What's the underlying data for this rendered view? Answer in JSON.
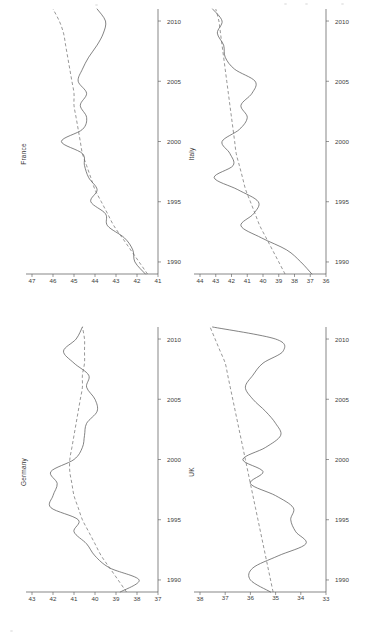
{
  "figure": {
    "orientation": "rotated-90-ccw",
    "background": "#ffffff",
    "line_color": "#5a5a5a",
    "trend_color": "#6a6a6a",
    "panel_count": 4
  },
  "chart_data": [
    {
      "type": "line",
      "title": "France",
      "xlabel": "",
      "ylabel": "",
      "xlim": [
        1989,
        2011
      ],
      "ylim": [
        41,
        47
      ],
      "xticks": [
        1990,
        1995,
        2000,
        2005,
        2010
      ],
      "xtick_labels": [
        "1990",
        "1995",
        "2000",
        "2005",
        "2010"
      ],
      "yticks": [
        41,
        42,
        43,
        44,
        45,
        46,
        47
      ],
      "ytick_labels": [
        "41",
        "42",
        "43",
        "44",
        "45",
        "46",
        "47"
      ],
      "grid": false,
      "legend": "none",
      "x": [
        1989,
        1990,
        1991,
        1992,
        1993,
        1994,
        1995,
        1996,
        1997,
        1998,
        1999,
        2000,
        2001,
        2002,
        2003,
        2004,
        2005,
        2006,
        2007,
        2008,
        2009,
        2010,
        2011
      ],
      "series": [
        {
          "name": "actual",
          "style": "solid",
          "values": [
            41.6,
            42.1,
            42.2,
            42.6,
            43.4,
            43.5,
            44.2,
            43.9,
            44.3,
            44.5,
            44.6,
            45.6,
            44.6,
            44.4,
            44.7,
            44.4,
            44.8,
            44.6,
            44.3,
            43.9,
            43.6,
            43.5,
            43.9
          ]
        },
        {
          "name": "trend",
          "style": "dashed",
          "values": [
            41.5,
            41.9,
            42.3,
            42.7,
            43.1,
            43.4,
            43.7,
            44.0,
            44.2,
            44.4,
            44.6,
            44.7,
            44.8,
            44.9,
            45.0,
            45.0,
            45.1,
            45.2,
            45.3,
            45.4,
            45.5,
            45.7,
            46.0
          ]
        }
      ]
    },
    {
      "type": "line",
      "title": "Italy",
      "xlabel": "",
      "ylabel": "",
      "xlim": [
        1989,
        2011
      ],
      "ylim": [
        36,
        44
      ],
      "xticks": [
        1990,
        1995,
        2000,
        2005,
        2010
      ],
      "xtick_labels": [
        "1990",
        "1995",
        "2000",
        "2005",
        "2010"
      ],
      "yticks": [
        36,
        37,
        38,
        39,
        40,
        41,
        42,
        43,
        44
      ],
      "ytick_labels": [
        "36",
        "37",
        "38",
        "39",
        "40",
        "41",
        "42",
        "43",
        "44"
      ],
      "grid": false,
      "legend": "none",
      "x": [
        1989,
        1990,
        1991,
        1992,
        1993,
        1994,
        1995,
        1996,
        1997,
        1998,
        1999,
        2000,
        2001,
        2002,
        2003,
        2004,
        2005,
        2006,
        2007,
        2008,
        2009,
        2010,
        2011
      ],
      "series": [
        {
          "name": "actual",
          "style": "solid",
          "values": [
            36.9,
            37.6,
            38.5,
            40.1,
            41.4,
            40.6,
            40.3,
            41.6,
            43.1,
            41.9,
            42.1,
            42.6,
            41.5,
            41.0,
            41.4,
            40.7,
            40.5,
            41.8,
            42.4,
            42.5,
            42.9,
            42.6,
            43.2
          ]
        },
        {
          "name": "trend",
          "style": "dashed",
          "values": [
            38.6,
            39.0,
            39.4,
            39.8,
            40.2,
            40.5,
            40.8,
            41.1,
            41.3,
            41.5,
            41.7,
            41.8,
            41.9,
            42.0,
            42.1,
            42.2,
            42.3,
            42.4,
            42.5,
            42.6,
            42.7,
            42.8,
            43.0
          ]
        }
      ]
    },
    {
      "type": "line",
      "title": "Germany",
      "xlabel": "",
      "ylabel": "",
      "xlim": [
        1989,
        2011
      ],
      "ylim": [
        37,
        43
      ],
      "xticks": [
        1990,
        1995,
        2000,
        2005,
        2010
      ],
      "xtick_labels": [
        "1990",
        "1995",
        "2000",
        "2005",
        "2010"
      ],
      "yticks": [
        37,
        38,
        39,
        40,
        41,
        42,
        43
      ],
      "ytick_labels": [
        "37",
        "38",
        "39",
        "40",
        "41",
        "42",
        "43"
      ],
      "grid": false,
      "legend": "none",
      "x": [
        1989,
        1990,
        1991,
        1992,
        1993,
        1994,
        1995,
        1996,
        1997,
        1998,
        1999,
        2000,
        2001,
        2002,
        2003,
        2004,
        2005,
        2006,
        2007,
        2008,
        2009,
        2010,
        2011
      ],
      "series": [
        {
          "name": "actual",
          "style": "solid",
          "values": [
            38.8,
            37.9,
            39.3,
            40.0,
            40.4,
            41.0,
            40.8,
            42.1,
            42.0,
            41.8,
            42.1,
            41.0,
            40.6,
            40.5,
            40.4,
            39.9,
            40.0,
            40.4,
            40.3,
            41.0,
            41.5,
            40.9,
            40.6
          ]
        },
        {
          "name": "trend",
          "style": "dashed",
          "values": [
            38.5,
            38.9,
            39.3,
            39.7,
            40.0,
            40.3,
            40.6,
            40.8,
            41.0,
            41.1,
            41.2,
            41.2,
            41.1,
            41.0,
            40.9,
            40.8,
            40.7,
            40.6,
            40.6,
            40.5,
            40.5,
            40.5,
            40.6
          ]
        }
      ]
    },
    {
      "type": "line",
      "title": "UK",
      "xlabel": "",
      "ylabel": "",
      "xlim": [
        1989,
        2011
      ],
      "ylim": [
        33,
        38
      ],
      "xticks": [
        1990,
        1995,
        2000,
        2005,
        2010
      ],
      "xtick_labels": [
        "1990",
        "1995",
        "2000",
        "2005",
        "2010"
      ],
      "yticks": [
        33,
        34,
        35,
        36,
        37,
        38
      ],
      "ytick_labels": [
        "33",
        "34",
        "35",
        "36",
        "37",
        "38"
      ],
      "grid": false,
      "legend": "none",
      "x": [
        1989,
        1990,
        1991,
        1992,
        1993,
        1994,
        1995,
        1996,
        1997,
        1998,
        1999,
        2000,
        2001,
        2002,
        2003,
        2004,
        2005,
        2006,
        2007,
        2008,
        2009,
        2010,
        2011
      ],
      "series": [
        {
          "name": "actual",
          "style": "solid",
          "values": [
            35.2,
            36.0,
            35.9,
            34.9,
            33.8,
            34.2,
            34.4,
            34.3,
            35.0,
            36.0,
            35.5,
            36.3,
            35.4,
            34.8,
            35.0,
            35.4,
            35.9,
            36.2,
            35.9,
            35.5,
            34.7,
            35.0,
            37.5
          ]
        },
        {
          "name": "trend",
          "style": "dashed",
          "values": [
            35.1,
            35.2,
            35.3,
            35.4,
            35.5,
            35.6,
            35.7,
            35.8,
            35.9,
            36.0,
            36.1,
            36.2,
            36.3,
            36.4,
            36.5,
            36.6,
            36.7,
            36.8,
            36.9,
            37.0,
            37.2,
            37.4,
            37.6
          ]
        }
      ]
    }
  ]
}
